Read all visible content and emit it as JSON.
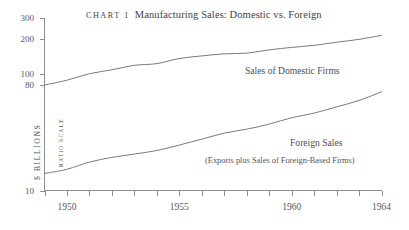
{
  "chart_data": {
    "type": "line",
    "title": "Manufacturing Sales: Domestic vs. Foreign",
    "kicker": "Chart 1",
    "xlabel": "",
    "ylabel": "$ BILLIONS",
    "scale_note": "RATIO SCALE",
    "yscale": "log",
    "ylim": [
      10,
      300
    ],
    "xlim": [
      1949,
      1964
    ],
    "grid": false,
    "legend_position": "inline-annotation",
    "ytick_labels": [
      "300",
      "200",
      "100",
      "80",
      "10"
    ],
    "ytick_values": [
      300,
      200,
      100,
      80,
      10
    ],
    "xtick_values": [
      1949,
      1950,
      1951,
      1952,
      1953,
      1954,
      1955,
      1956,
      1957,
      1958,
      1959,
      1960,
      1961,
      1962,
      1963,
      1964
    ],
    "xtick_labels_shown": [
      "1950",
      "1955",
      "1960",
      "1964"
    ],
    "xtick_labels_shown_values": [
      1950,
      1955,
      1960,
      1964
    ],
    "x": [
      1949,
      1950,
      1951,
      1952,
      1953,
      1954,
      1955,
      1956,
      1957,
      1958,
      1959,
      1960,
      1961,
      1962,
      1963,
      1964
    ],
    "series": [
      {
        "name": "Sales of Domestic Firms",
        "annotation": "Sales of Domestic Firms",
        "annotation_sub": "",
        "values": [
          80,
          88,
          100,
          108,
          118,
          122,
          135,
          142,
          148,
          150,
          160,
          168,
          175,
          186,
          197,
          213
        ]
      },
      {
        "name": "Foreign Sales",
        "annotation": "Foreign Sales",
        "annotation_sub": "(Exports plus Sales of Foreign-Based Firms)",
        "values": [
          14,
          15.2,
          17.5,
          19.2,
          20.5,
          22.0,
          24.5,
          27.5,
          31.0,
          33.5,
          37.0,
          42.0,
          46.0,
          52.0,
          59.0,
          70.0
        ]
      }
    ]
  }
}
